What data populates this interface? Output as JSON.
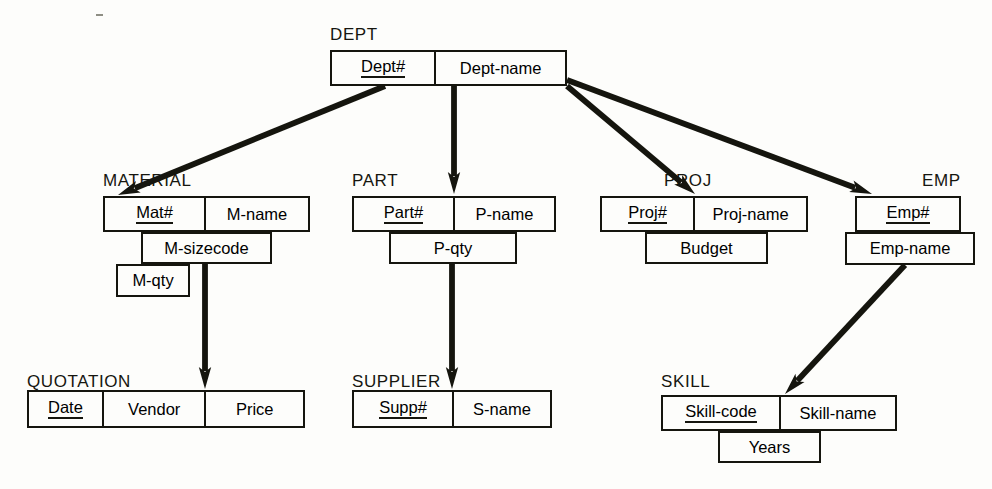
{
  "diagram": {
    "type": "database-schema-er-diagram",
    "background_color": "#fdfdfb",
    "line_color": "#15150e",
    "entities": [
      {
        "id": "dept",
        "name": "DEPT",
        "title_x": 330,
        "title_y": 26,
        "rows": [
          {
            "x": 330,
            "y": 50,
            "w": 237,
            "h": 36,
            "cells": [
              {
                "label": "Dept#",
                "w": 104,
                "key": true
              },
              {
                "label": "Dept-name",
                "w": 133,
                "key": false
              }
            ]
          }
        ]
      },
      {
        "id": "material",
        "name": "MATERIAL",
        "title_x": 103,
        "title_y": 172,
        "rows": [
          {
            "x": 103,
            "y": 196,
            "w": 207,
            "h": 36,
            "cells": [
              {
                "label": "Mat#",
                "w": 101,
                "key": true
              },
              {
                "label": "M-name",
                "w": 106,
                "key": false
              }
            ]
          },
          {
            "x": 141,
            "y": 232,
            "w": 131,
            "h": 32,
            "cells": [
              {
                "label": "M-sizecode",
                "w": 131,
                "key": false
              }
            ]
          },
          {
            "x": 116,
            "y": 264,
            "w": 74,
            "h": 33,
            "cells": [
              {
                "label": "M-qty",
                "w": 74,
                "key": false
              }
            ]
          }
        ]
      },
      {
        "id": "part",
        "name": "PART",
        "title_x": 352,
        "title_y": 172,
        "rows": [
          {
            "x": 352,
            "y": 196,
            "w": 204,
            "h": 36,
            "cells": [
              {
                "label": "Part#",
                "w": 101,
                "key": true
              },
              {
                "label": "P-name",
                "w": 103,
                "key": false
              }
            ]
          },
          {
            "x": 389,
            "y": 232,
            "w": 128,
            "h": 32,
            "cells": [
              {
                "label": "P-qty",
                "w": 128,
                "key": false
              }
            ]
          }
        ]
      },
      {
        "id": "proj",
        "name": "PROJ",
        "title_x": 664,
        "title_y": 172,
        "rows": [
          {
            "x": 600,
            "y": 196,
            "w": 208,
            "h": 36,
            "cells": [
              {
                "label": "Proj#",
                "w": 93,
                "key": true
              },
              {
                "label": "Proj-name",
                "w": 115,
                "key": false
              }
            ]
          },
          {
            "x": 645,
            "y": 232,
            "w": 123,
            "h": 32,
            "cells": [
              {
                "label": "Budget",
                "w": 123,
                "key": false
              }
            ]
          }
        ]
      },
      {
        "id": "emp",
        "name": "EMP",
        "title_x": 922,
        "title_y": 172,
        "rows": [
          {
            "x": 855,
            "y": 196,
            "w": 106,
            "h": 36,
            "cells": [
              {
                "label": "Emp#",
                "w": 106,
                "key": true
              }
            ]
          },
          {
            "x": 845,
            "y": 232,
            "w": 130,
            "h": 33,
            "cells": [
              {
                "label": "Emp-name",
                "w": 130,
                "key": false
              }
            ]
          }
        ]
      },
      {
        "id": "quotation",
        "name": "QUOTATION",
        "title_x": 27,
        "title_y": 373,
        "rows": [
          {
            "x": 27,
            "y": 390,
            "w": 278,
            "h": 38,
            "cells": [
              {
                "label": "Date",
                "w": 74,
                "key": true
              },
              {
                "label": "Vendor",
                "w": 104,
                "key": false
              },
              {
                "label": "Price",
                "w": 100,
                "key": false
              }
            ]
          }
        ]
      },
      {
        "id": "supplier",
        "name": "SUPPLIER",
        "title_x": 352,
        "title_y": 373,
        "rows": [
          {
            "x": 352,
            "y": 390,
            "w": 200,
            "h": 38,
            "cells": [
              {
                "label": "Supp#",
                "w": 100,
                "key": true
              },
              {
                "label": "S-name",
                "w": 100,
                "key": false
              }
            ]
          }
        ]
      },
      {
        "id": "skill",
        "name": "SKILL",
        "title_x": 661,
        "title_y": 373,
        "rows": [
          {
            "x": 661,
            "y": 395,
            "w": 236,
            "h": 36,
            "cells": [
              {
                "label": "Skill-code",
                "w": 118,
                "key": true
              },
              {
                "label": "Skill-name",
                "w": 118,
                "key": false
              }
            ]
          },
          {
            "x": 718,
            "y": 431,
            "w": 103,
            "h": 32,
            "cells": [
              {
                "label": "Years",
                "w": 103,
                "key": false
              }
            ]
          }
        ]
      }
    ],
    "arrows": [
      {
        "id": "dept-to-material",
        "from": "dept",
        "to": "material",
        "x1": 385,
        "y1": 86,
        "x2": 118,
        "y2": 195
      },
      {
        "id": "dept-to-part",
        "from": "dept",
        "to": "part",
        "x1": 454,
        "y1": 86,
        "x2": 454,
        "y2": 194
      },
      {
        "id": "dept-to-proj",
        "from": "dept",
        "to": "proj",
        "x1": 567,
        "y1": 86,
        "x2": 695,
        "y2": 194
      },
      {
        "id": "dept-to-emp",
        "from": "dept",
        "to": "emp",
        "x1": 567,
        "y1": 80,
        "x2": 872,
        "y2": 194
      },
      {
        "id": "material-to-quotation",
        "from": "material",
        "to": "quotation",
        "x1": 205,
        "y1": 232,
        "x2": 205,
        "y2": 389
      },
      {
        "id": "part-to-supplier",
        "from": "part",
        "to": "supplier",
        "x1": 452,
        "y1": 232,
        "x2": 452,
        "y2": 389
      },
      {
        "id": "emp-to-skill",
        "from": "emp",
        "to": "skill",
        "x1": 905,
        "y1": 265,
        "x2": 785,
        "y2": 394
      }
    ]
  }
}
